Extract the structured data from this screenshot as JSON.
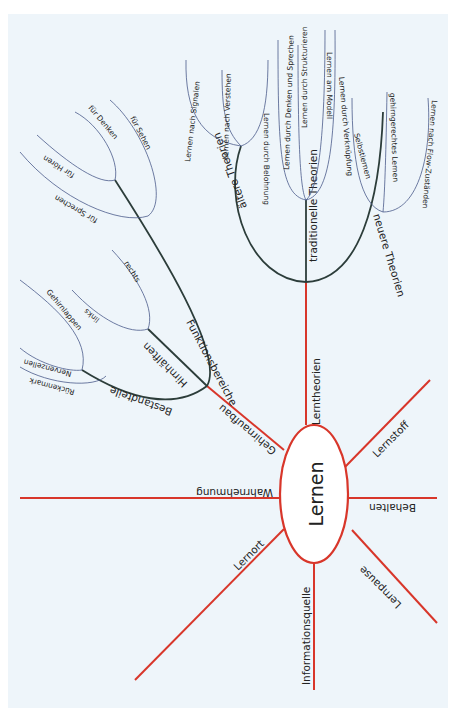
{
  "center": {
    "label": "Lernen"
  },
  "colors": {
    "main_branch": "#d8362a",
    "sub_branch": "#2c3d3a",
    "leaf_branch": "#4a5a8a",
    "background": "#eef5fa",
    "center_fill": "#ffffff"
  },
  "main_branches": {
    "lerntheorien": "Lerntheorien",
    "gehirnaufbau": "Gehirnaufbau",
    "wahrnehmung": "Wahrnehmung",
    "lernort": "Lernort",
    "informationsquelle": "Informationsquelle",
    "lernpause": "Lernpause",
    "behalten": "Behalten",
    "lernstoff": "Lernstoff"
  },
  "lerntheorien": {
    "aeltere": {
      "label": "ältere Theorien",
      "leaves": [
        "Lernen nach Signalen",
        "Lernen nach Verstehen",
        "Lernen durch Belohnung"
      ]
    },
    "traditionelle": {
      "label": "traditionelle Theorien",
      "leaves": [
        "Lernen durch Denken und Sprechen",
        "Lernen durch Strukturieren",
        "Lernen am Modell",
        "Lernen durch Verknüpfung"
      ]
    },
    "neuere": {
      "label": "neuere Theorien",
      "leaves": [
        "Selbstlernen",
        "gehirngerechtes Lernen",
        "Lernen nach Flow-Zuständen"
      ]
    }
  },
  "gehirnaufbau": {
    "funktionsbereiche": {
      "label": "Funktionsbereiche",
      "leaves": [
        "für Sehen",
        "für Denken",
        "für Hören",
        "für Sprechen"
      ]
    },
    "hirnhaelften": {
      "label": "Hirnhälften",
      "leaves": [
        "rechts",
        "links"
      ]
    },
    "bestandteile": {
      "label": "Bestandteile",
      "leaves": [
        "Gehirnlappen",
        "Nervenzellen",
        "Rückenmark"
      ]
    }
  }
}
